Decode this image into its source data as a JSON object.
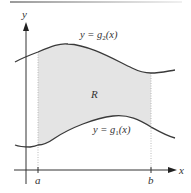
{
  "diagram": {
    "region_label": "R",
    "upper_curve": {
      "label": "y = g₂(x)",
      "label_parts": {
        "prefix": "y = g",
        "subscript": "2",
        "suffix": "(x)"
      }
    },
    "lower_curve": {
      "label": "y = g₁(x)",
      "label_parts": {
        "prefix": "y = g",
        "subscript": "1",
        "suffix": "(x)"
      }
    },
    "axes": {
      "x_label": "x",
      "y_label": "y"
    },
    "ticks": {
      "a": "a",
      "b": "b"
    },
    "colors": {
      "curve": "#3a3a3a",
      "axis": "#333333",
      "shade": "#e6e6e6",
      "dotted": "#9a9a9a"
    }
  }
}
